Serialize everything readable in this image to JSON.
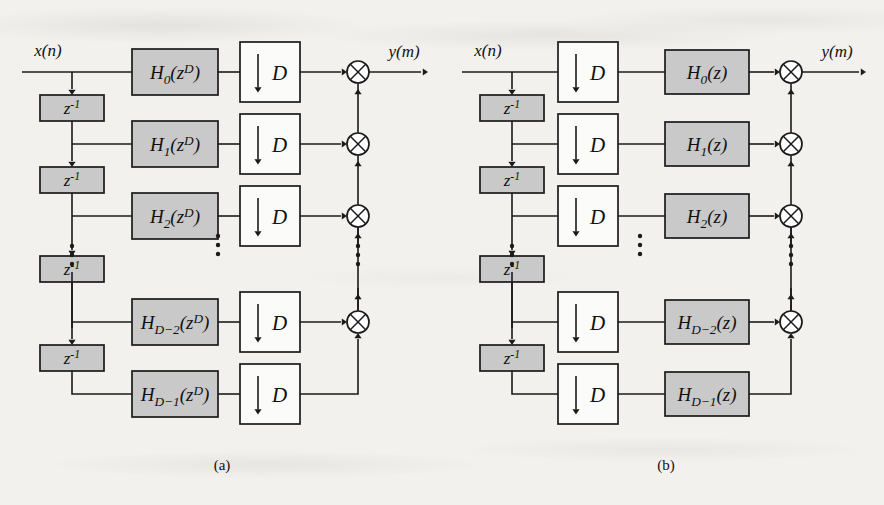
{
  "figure": {
    "background_color": "#f3f1ee",
    "ink_color": "#1b1b1b",
    "shaded_block_color": "#c9c9c9",
    "open_block_color": "#fbfbfa",
    "captions": [
      {
        "id": "caption-a",
        "text": "(a)",
        "x": 222,
        "y": 470
      },
      {
        "id": "caption-b",
        "text": "(b)",
        "x": 666,
        "y": 470
      }
    ]
  },
  "panels": [
    {
      "id": "panel-a",
      "caption": "(a)",
      "description": "Polyphase decimator, filtering before downsampling",
      "input_label": "x(n)",
      "output_label": "y(m)",
      "stage_order": [
        "filter",
        "decimator"
      ],
      "delay_label": {
        "base": "z",
        "exponent": "-1",
        "text": "z-1"
      },
      "decimator_label": {
        "arrow": "↓",
        "factor": "D",
        "text": "↓ D"
      },
      "branches": [
        {
          "index": 0,
          "filter_base": "H",
          "filter_sub": "0",
          "filter_arg": "z",
          "filter_arg_sup": "D",
          "filter_text": "H0(zD)"
        },
        {
          "index": 1,
          "filter_base": "H",
          "filter_sub": "1",
          "filter_arg": "z",
          "filter_arg_sup": "D",
          "filter_text": "H1(zD)"
        },
        {
          "index": 2,
          "filter_base": "H",
          "filter_sub": "2",
          "filter_arg": "z",
          "filter_arg_sup": "D",
          "filter_text": "H2(zD)"
        },
        {
          "index": 3,
          "filter_base": "H",
          "filter_sub": "D−2",
          "filter_arg": "z",
          "filter_arg_sup": "D",
          "filter_text": "HD-2(zD)"
        },
        {
          "index": 4,
          "filter_base": "H",
          "filter_sub": "D−1",
          "filter_arg": "z",
          "filter_arg_sup": "D",
          "filter_text": "HD-1(zD)"
        }
      ],
      "delay_count": 4,
      "adder_count": 4,
      "ellipsis_columns": [
        "delay-bus",
        "mid-stage",
        "adder-bus"
      ]
    },
    {
      "id": "panel-b",
      "caption": "(b)",
      "description": "Polyphase decimator, downsampling before filtering",
      "input_label": "x(n)",
      "output_label": "y(m)",
      "stage_order": [
        "decimator",
        "filter"
      ],
      "delay_label": {
        "base": "z",
        "exponent": "-1",
        "text": "z-1"
      },
      "decimator_label": {
        "arrow": "↓",
        "factor": "D",
        "text": "↓ D"
      },
      "branches": [
        {
          "index": 0,
          "filter_base": "H",
          "filter_sub": "0",
          "filter_arg": "z",
          "filter_arg_sup": "",
          "filter_text": "H0(z)"
        },
        {
          "index": 1,
          "filter_base": "H",
          "filter_sub": "1",
          "filter_arg": "z",
          "filter_arg_sup": "",
          "filter_text": "H1(z)"
        },
        {
          "index": 2,
          "filter_base": "H",
          "filter_sub": "2",
          "filter_arg": "z",
          "filter_arg_sup": "",
          "filter_text": "H2(z)"
        },
        {
          "index": 3,
          "filter_base": "H",
          "filter_sub": "D−2",
          "filter_arg": "z",
          "filter_arg_sup": "",
          "filter_text": "HD-2(z)"
        },
        {
          "index": 4,
          "filter_base": "H",
          "filter_sub": "D−1",
          "filter_arg": "z",
          "filter_arg_sup": "",
          "filter_text": "HD-1(z)"
        }
      ],
      "delay_count": 4,
      "adder_count": 4,
      "ellipsis_columns": [
        "delay-bus",
        "mid-stage",
        "adder-bus"
      ]
    }
  ],
  "geometry": {
    "row_y": [
      72,
      144,
      216,
      322,
      394
    ],
    "gap_rows": [
      2,
      3
    ],
    "panel_a": {
      "bus_x": 72,
      "delay_box": {
        "x": 40,
        "w": 64,
        "h": 26
      },
      "stage1": {
        "x": 132,
        "w": 86,
        "h": 46
      },
      "stage2": {
        "x": 240,
        "w": 60,
        "h": 60
      },
      "adder_x": 358,
      "out_end_x": 428,
      "in_start_x": 22,
      "ellipsis_x": [
        72,
        218,
        358
      ]
    },
    "panel_b": {
      "bus_x": 512,
      "delay_box": {
        "x": 480,
        "w": 64,
        "h": 26
      },
      "stage1": {
        "x": 558,
        "w": 60,
        "h": 60
      },
      "stage2": {
        "x": 665,
        "w": 84,
        "h": 44
      },
      "adder_x": 791,
      "out_end_x": 866,
      "in_start_x": 462,
      "ellipsis_x": [
        512,
        640,
        791
      ]
    }
  }
}
